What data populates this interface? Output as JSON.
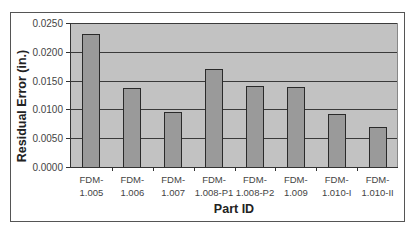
{
  "chart_data": {
    "type": "bar",
    "title": "",
    "xlabel": "Part ID",
    "ylabel": "Residual Error (in.)",
    "categories": [
      "FDM-1.005",
      "FDM-1.006",
      "FDM-1.007",
      "FDM-1.008-P1",
      "FDM-1.008-P2",
      "FDM-1.009",
      "FDM-1.010-I",
      "FDM-1.010-II"
    ],
    "category_lines": [
      [
        "FDM-",
        "1.005"
      ],
      [
        "FDM-",
        "1.006"
      ],
      [
        "FDM-",
        "1.007"
      ],
      [
        "FDM-",
        "1.008-P1"
      ],
      [
        "FDM-",
        "1.008-P2"
      ],
      [
        "FDM-",
        "1.009"
      ],
      [
        "FDM-",
        "1.010-I"
      ],
      [
        "FDM-",
        "1.010-II"
      ]
    ],
    "values": [
      0.0231,
      0.0137,
      0.0095,
      0.017,
      0.0141,
      0.0139,
      0.0092,
      0.0069
    ],
    "ylim": [
      0,
      0.025
    ],
    "yticks": [
      "0.0000",
      "0.0050",
      "0.0100",
      "0.0150",
      "0.0200",
      "0.0250"
    ],
    "ytick_values": [
      0,
      0.005,
      0.01,
      0.015,
      0.02,
      0.025
    ],
    "grid": true,
    "legend": null,
    "colors": {
      "bar": "#9a9a9a",
      "plot_bg": "#c2c2c2",
      "grid": "#3a3a3a"
    }
  }
}
